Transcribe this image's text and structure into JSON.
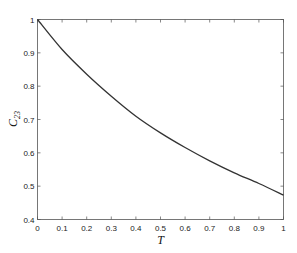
{
  "chart_data": {
    "type": "line",
    "title": "",
    "xlabel": "T",
    "ylabel": "C23",
    "ylabel_main": "C",
    "ylabel_sub": "23",
    "xlim": [
      0,
      1
    ],
    "ylim": [
      0.4,
      1
    ],
    "grid": false,
    "legend": null,
    "x_ticks": [
      "0",
      "0.1",
      "0.2",
      "0.3",
      "0.4",
      "0.5",
      "0.6",
      "0.7",
      "0.8",
      "0.9",
      "1"
    ],
    "y_ticks": [
      "0.4",
      "0.5",
      "0.6",
      "0.7",
      "0.8",
      "0.9",
      "1"
    ],
    "series": [
      {
        "name": "C23",
        "color": "#333333",
        "x": [
          0,
          0.1,
          0.2,
          0.3,
          0.4,
          0.5,
          0.6,
          0.7,
          0.8,
          0.9,
          1.0
        ],
        "y": [
          1.0,
          0.91,
          0.836,
          0.77,
          0.71,
          0.66,
          0.616,
          0.576,
          0.54,
          0.508,
          0.473
        ]
      }
    ]
  }
}
